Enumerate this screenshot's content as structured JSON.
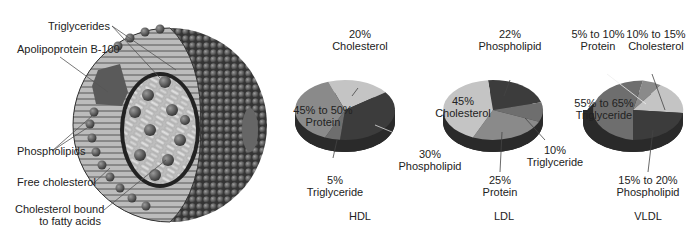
{
  "particle": {
    "labels": {
      "triglycerides": "Triglycerides",
      "apolipoprotein": "Apolipoprotein B-100",
      "phospholipids": "Phospholipids",
      "free_cholesterol": "Free cholesterol",
      "bound_cholesterol_1": "Cholesterol bound",
      "bound_cholesterol_2": "to fatty acids"
    }
  },
  "pies": {
    "hdl": {
      "title": "HDL",
      "cholesterol": [
        "20%",
        "Cholesterol"
      ],
      "protein": [
        "45% to 50%",
        "Protein"
      ],
      "phospholipid": [
        "30%",
        "Phospholipid"
      ],
      "triglyceride": [
        "5%",
        "Triglyceride"
      ]
    },
    "ldl": {
      "title": "LDL",
      "phospholipid": [
        "22%",
        "Phospholipid"
      ],
      "cholesterol": [
        "45%",
        "Cholesterol"
      ],
      "triglyceride": [
        "10%",
        "Triglyceride"
      ],
      "protein": [
        "25%",
        "Protein"
      ]
    },
    "vldl": {
      "title": "VLDL",
      "protein": [
        "5% to 10%",
        "Protein"
      ],
      "cholesterol": [
        "10% to 15%",
        "Cholesterol"
      ],
      "triglyceride": [
        "55% to 65%",
        "Triglyceride"
      ],
      "phospholipid": [
        "15% to 20%",
        "Phospholipid"
      ]
    }
  },
  "colors": {
    "cholesterol": "#c4c4c4",
    "protein": "#8a8a8a",
    "phospholipid": "#3c3c3c",
    "triglyceride": "#6e6e6e",
    "shell_dark": "#4a4a4a",
    "core_light": "#d8d8d8"
  }
}
